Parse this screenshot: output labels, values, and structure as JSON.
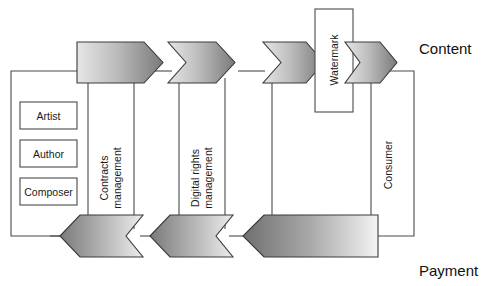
{
  "diagram": {
    "side_labels": {
      "content": "Content",
      "payment": "Payment"
    },
    "creators_group": {
      "items": [
        {
          "label": "Artist"
        },
        {
          "label": "Author"
        },
        {
          "label": "Composer"
        }
      ]
    },
    "columns": [
      {
        "id": "contracts",
        "label_line1": "Contracts",
        "label_line2": "management"
      },
      {
        "id": "drm",
        "label_line1": "Digital rights",
        "label_line2": "management"
      },
      {
        "id": "consumer",
        "label_line1": "Consumer",
        "label_line2": ""
      }
    ],
    "watermark": {
      "label": "Watermark"
    },
    "flow_top": {
      "direction": "right",
      "arrows": [
        {
          "id": "top-arrow-1",
          "shape": "pentagon"
        },
        {
          "id": "top-arrow-2",
          "shape": "chevron"
        },
        {
          "id": "top-arrow-3",
          "shape": "chevron"
        },
        {
          "id": "top-arrow-4",
          "shape": "chevron"
        }
      ]
    },
    "flow_bottom": {
      "direction": "left",
      "arrows": [
        {
          "id": "bottom-arrow-1",
          "shape": "chevron-left"
        },
        {
          "id": "bottom-arrow-2",
          "shape": "chevron-left"
        },
        {
          "id": "bottom-arrow-3",
          "shape": "pentagon-left"
        }
      ]
    },
    "colors": {
      "gradient_light": "#e2e2e2",
      "gradient_dark": "#7c7c7c",
      "stroke": "#4a4a4a",
      "background": "#ffffff",
      "text": "#1a1a1a"
    }
  }
}
